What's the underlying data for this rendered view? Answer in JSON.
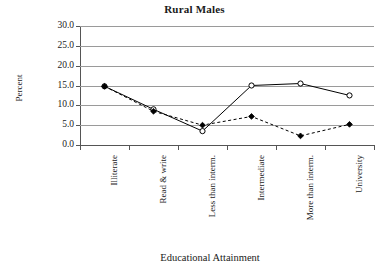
{
  "chart_data": {
    "type": "line",
    "title": "Rural Males",
    "xlabel": "Educational Attainment",
    "ylabel": "Percent",
    "categories": [
      "Illiterate",
      "Read & write",
      "Less than interm.",
      "Intermediate",
      "More than interm.",
      "University"
    ],
    "ylim": [
      0.0,
      30.0
    ],
    "ytick_labels": [
      "0.0",
      "5.0",
      "10.0",
      "15.0",
      "20.0",
      "25.0",
      "30.0"
    ],
    "ytick_values": [
      0.0,
      5.0,
      10.0,
      15.0,
      20.0,
      25.0,
      30.0
    ],
    "grid": true,
    "legend": "none",
    "series": [
      {
        "name": "series-open-circle-solid",
        "marker": "open-circle",
        "line_style": "solid",
        "color": "#000000",
        "values": [
          14.8,
          9.0,
          3.5,
          15.0,
          15.5,
          12.5
        ]
      },
      {
        "name": "series-filled-diamond-dashed",
        "marker": "filled-diamond",
        "line_style": "dashed",
        "color": "#000000",
        "values": [
          14.8,
          8.5,
          5.0,
          7.2,
          2.3,
          5.2
        ]
      }
    ]
  },
  "axes": {
    "y_title": "Percent",
    "x_title": "Educational Attainment"
  }
}
